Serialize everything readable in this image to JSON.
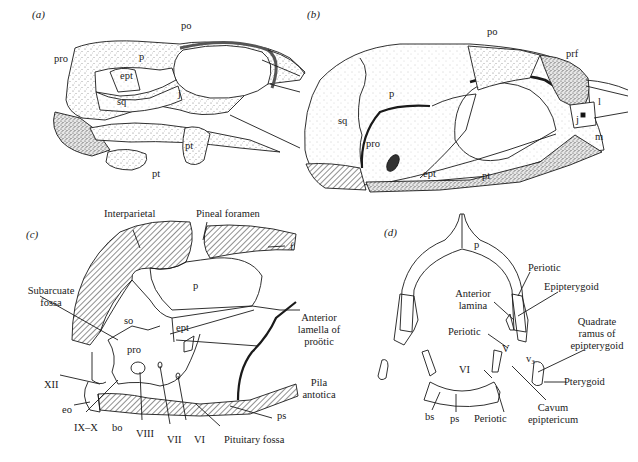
{
  "figure": {
    "panels": [
      {
        "id": "a",
        "label": "(a)"
      },
      {
        "id": "b",
        "label": "(b)"
      },
      {
        "id": "c",
        "label": "(c)"
      },
      {
        "id": "d",
        "label": "(d)"
      }
    ]
  },
  "panel_a": {
    "labels": {
      "po": "po",
      "pro": "pro",
      "p": "p",
      "ept": "ept",
      "sq": "sq",
      "j": "j",
      "pt_upper": "pt",
      "pt_lower": "pt"
    }
  },
  "panel_b": {
    "labels": {
      "po": "po",
      "prf": "prf",
      "l": "l",
      "j": "j",
      "m": "m",
      "sq": "sq",
      "p": "p",
      "pro": "pro",
      "ept": "ept",
      "pt": "pt"
    }
  },
  "panel_c": {
    "labels": {
      "interparietal": "Interparietal",
      "pineal_foramen": "Pineal  foramen",
      "f": "f",
      "p": "p",
      "subarcuate_fossa_1": "Subarcuate",
      "subarcuate_fossa_2": "fossa",
      "so": "so",
      "ept": "ept",
      "pro": "pro",
      "anterior_lamella_1": "Anterior",
      "anterior_lamella_2": "lamella of",
      "anterior_lamella_3": "proötic",
      "pila_antotica_1": "Pila",
      "pila_antotica_2": "antotica",
      "xii": "XII",
      "eo": "eo",
      "ix_x": "IX–X",
      "bo": "bo",
      "viii": "VIII",
      "vii": "VII",
      "vi": "VI",
      "pituitary_fossa": "Pituitary  fossa",
      "ps": "ps"
    }
  },
  "panel_d": {
    "labels": {
      "p": "p",
      "periotic_upper": "Periotic",
      "epipterygoid": "Epipterygoid",
      "anterior_lamina_1": "Anterior",
      "anterior_lamina_2": "lamina",
      "quadrate_ramus_1": "Quadrate",
      "quadrate_ramus_2": "ramus of",
      "quadrate_ramus_3": "epipterygoid",
      "periotic_middle": "Periotic",
      "v": "V",
      "v3": "v₃",
      "vi": "VI",
      "pterygoid": "Pterygoid",
      "bs": "bs",
      "ps": "ps",
      "periotic_lower": "Periotic",
      "cavum_1": "Cavum",
      "cavum_2": "epiptericum"
    }
  },
  "colors": {
    "ink": "#1a1a1a",
    "background": "#ffffff",
    "stipple": "#9a9a9a"
  }
}
